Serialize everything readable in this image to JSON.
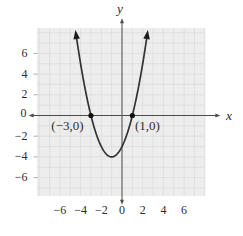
{
  "figure": {
    "background": "#ffffff",
    "plot_background": "#ededed",
    "gridline_color": "#dcdcdc",
    "edge_tick_color": "#9a9a9a",
    "axis_color": "#4d4d4d",
    "curve_color": "#333333",
    "marker_color": "#111111",
    "label_color": "#2e2e2e"
  },
  "chart_data": {
    "type": "line",
    "title": "",
    "xlabel": "x",
    "ylabel": "y",
    "xlim": [
      -8.2,
      8.0
    ],
    "ylim": [
      -7.8,
      8.5
    ],
    "xticks": [
      -6,
      -4,
      -2,
      0,
      2,
      4,
      6
    ],
    "yticks": [
      -6,
      -4,
      -2,
      0,
      2,
      4,
      6
    ],
    "grid": true,
    "grid_step": 1,
    "series": [
      {
        "name": "parabola",
        "equation_coefficients": {
          "a": 1,
          "b": 2,
          "c": -3
        },
        "x_domain": [
          -4.5,
          2.5
        ],
        "vertex": {
          "x": -1,
          "y": -4
        },
        "end_arrows": true,
        "x": [
          -4.5,
          -4,
          -3.5,
          -3,
          -2.5,
          -2,
          -1.5,
          -1,
          -0.5,
          0,
          0.5,
          1,
          1.5,
          2,
          2.5
        ],
        "y": [
          8.25,
          5,
          2.25,
          0,
          -1.75,
          -3,
          -3.75,
          -4,
          -3.75,
          -3,
          -1.75,
          0,
          2.25,
          5,
          8.25
        ]
      }
    ],
    "points": [
      {
        "x": -3,
        "y": 0,
        "label": "(−3,0)"
      },
      {
        "x": 1,
        "y": 0,
        "label": "(1,0)"
      }
    ]
  }
}
